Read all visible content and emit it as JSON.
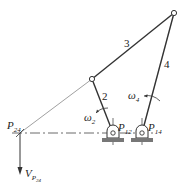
{
  "figure": {
    "links": [
      {
        "id": "link-2",
        "label": "2"
      },
      {
        "id": "link-3",
        "label": "3"
      },
      {
        "id": "link-4",
        "label": "4"
      }
    ],
    "angular_velocities": [
      {
        "id": "omega-2",
        "symbol": "ω",
        "sub": "2"
      },
      {
        "id": "omega-4",
        "symbol": "ω",
        "sub": "4"
      }
    ],
    "instant_centers": [
      {
        "id": "p12",
        "symbol": "P",
        "sub": "12"
      },
      {
        "id": "p14",
        "symbol": "P",
        "sub": "14"
      },
      {
        "id": "p24",
        "symbol": "P",
        "sub": "24"
      }
    ],
    "velocity": {
      "symbol": "V",
      "sub_main": "P",
      "sub_sub": "24"
    },
    "colors": {
      "line": "#333333",
      "construction": "#888888",
      "ground": "#555555"
    }
  }
}
